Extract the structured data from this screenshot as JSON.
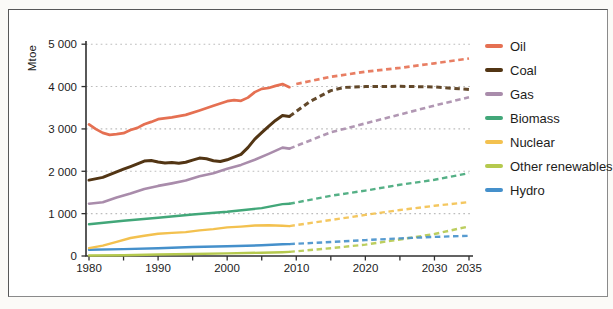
{
  "chart_data": {
    "type": "line",
    "ylabel": "Mtoe",
    "xlabel": "",
    "x_range": [
      1980,
      2035
    ],
    "ylim": [
      0,
      5000
    ],
    "grid": "dotted horizontal gridlines at every 1000 Mtoe",
    "legend_position": "right",
    "projection_start_year": 2009,
    "line_style_note": "solid = history (1980-2009), dashed = projection (2009-2035)",
    "axis_color": "#303030",
    "gridline_color": "#bdbdbd",
    "y_ticks": [
      "0",
      "1 000",
      "2 000",
      "3 000",
      "4 000",
      "5 000"
    ],
    "x_ticks": {
      "labels": [
        "1980",
        "1990",
        "2000",
        "2010",
        "2020",
        "2030",
        "2035"
      ],
      "minor_tick_interval_years": 5
    },
    "series": [
      {
        "name": "Oil",
        "color": "#e57052",
        "history": {
          "years": [
            1980,
            1981,
            1982,
            1983,
            1984,
            1985,
            1986,
            1987,
            1988,
            1989,
            1990,
            1992,
            1994,
            1996,
            1998,
            2000,
            2001,
            2002,
            2003,
            2004,
            2005,
            2006,
            2007,
            2008,
            2009
          ],
          "values": [
            3107,
            2995,
            2905,
            2860,
            2875,
            2900,
            2975,
            3025,
            3110,
            3165,
            3230,
            3275,
            3330,
            3435,
            3545,
            3655,
            3680,
            3665,
            3740,
            3870,
            3945,
            3965,
            4015,
            4059,
            3985
          ]
        },
        "projection": {
          "years": [
            2010,
            2015,
            2020,
            2025,
            2030,
            2035
          ],
          "values": [
            4060,
            4230,
            4350,
            4440,
            4550,
            4662
          ]
        }
      },
      {
        "name": "Coal",
        "color": "#523514",
        "history": {
          "years": [
            1980,
            1982,
            1984,
            1985,
            1986,
            1987,
            1988,
            1989,
            1990,
            1991,
            1992,
            1993,
            1994,
            1995,
            1996,
            1997,
            1998,
            1999,
            2000,
            2001,
            2002,
            2003,
            2004,
            2005,
            2006,
            2007,
            2008,
            2009
          ],
          "values": [
            1792,
            1855,
            1985,
            2050,
            2110,
            2175,
            2240,
            2255,
            2220,
            2195,
            2205,
            2190,
            2215,
            2265,
            2310,
            2295,
            2250,
            2230,
            2270,
            2335,
            2400,
            2560,
            2760,
            2910,
            3060,
            3200,
            3315,
            3295
          ]
        },
        "projection": {
          "years": [
            2009,
            2012,
            2015,
            2017,
            2020,
            2025,
            2030,
            2035
          ],
          "values": [
            3295,
            3650,
            3905,
            3980,
            4000,
            4005,
            3990,
            3934
          ]
        }
      },
      {
        "name": "Gas",
        "color": "#a98cab",
        "history": {
          "years": [
            1980,
            1982,
            1984,
            1986,
            1988,
            1990,
            1992,
            1994,
            1996,
            1998,
            2000,
            2002,
            2004,
            2006,
            2008,
            2009
          ],
          "values": [
            1234,
            1270,
            1380,
            1475,
            1585,
            1655,
            1715,
            1780,
            1885,
            1955,
            2060,
            2150,
            2270,
            2410,
            2560,
            2535
          ]
        },
        "projection": {
          "years": [
            2009,
            2015,
            2020,
            2025,
            2030,
            2035
          ],
          "values": [
            2535,
            2920,
            3130,
            3340,
            3550,
            3748
          ]
        }
      },
      {
        "name": "Biomass",
        "color": "#42a779",
        "history": {
          "years": [
            1980,
            1985,
            1990,
            1995,
            2000,
            2005,
            2008,
            2009
          ],
          "values": [
            749,
            830,
            905,
            980,
            1045,
            1130,
            1225,
            1232
          ]
        },
        "projection": {
          "years": [
            2009,
            2015,
            2020,
            2025,
            2030,
            2035
          ],
          "values": [
            1232,
            1420,
            1545,
            1680,
            1800,
            1957
          ]
        }
      },
      {
        "name": "Nuclear",
        "color": "#f3c14f",
        "history": {
          "years": [
            1980,
            1982,
            1984,
            1986,
            1988,
            1990,
            1992,
            1994,
            1996,
            1998,
            2000,
            2002,
            2004,
            2006,
            2008,
            2009
          ],
          "values": [
            186,
            245,
            335,
            425,
            480,
            525,
            545,
            565,
            605,
            635,
            675,
            695,
            720,
            728,
            715,
            705
          ]
        },
        "projection": {
          "years": [
            2009,
            2015,
            2020,
            2025,
            2030,
            2035
          ],
          "values": [
            705,
            850,
            970,
            1085,
            1185,
            1273
          ]
        }
      },
      {
        "name": "Other renewables",
        "color": "#b5c94e",
        "history": {
          "years": [
            1980,
            1985,
            1990,
            1995,
            2000,
            2005,
            2008,
            2009
          ],
          "values": [
            12,
            20,
            35,
            48,
            62,
            78,
            89,
            96
          ]
        },
        "projection": {
          "years": [
            2009,
            2015,
            2020,
            2025,
            2030,
            2035
          ],
          "values": [
            96,
            185,
            268,
            390,
            520,
            699
          ]
        }
      },
      {
        "name": "Hydro",
        "color": "#4590cb",
        "history": {
          "years": [
            1980,
            1985,
            1990,
            1995,
            2000,
            2005,
            2008,
            2009
          ],
          "values": [
            148,
            162,
            184,
            212,
            228,
            252,
            276,
            281
          ]
        },
        "projection": {
          "years": [
            2009,
            2015,
            2020,
            2025,
            2030,
            2035
          ],
          "values": [
            281,
            330,
            376,
            415,
            450,
            476
          ]
        }
      }
    ]
  }
}
